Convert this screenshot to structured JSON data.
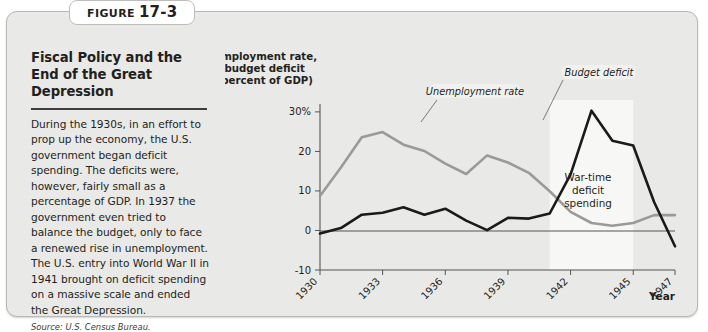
{
  "figure": {
    "label_word": "Figure",
    "number": "17-3",
    "title": "Fiscal Policy and the End of the Great Depression",
    "body": "During the 1930s, in an effort to prop up the economy, the U.S. government began deficit spending. The deficits were, however, fairly small as a percentage of GDP. In 1937 the government even tried to balance the budget, only to face a renewed rise in unemployment. The U.S. entry into World War II in 1941 brought on deficit spending on a massive scale and ended the Great Depression.",
    "source": "Source: U.S. Census Bureau."
  },
  "chart_data": {
    "type": "line",
    "title": "",
    "ylabel_lines": [
      "Unemployment rate,",
      "budget deficit",
      "(percent of GDP)"
    ],
    "xlabel": "Year",
    "ylim": [
      -10,
      32
    ],
    "xlim": [
      1930,
      1947
    ],
    "ytick_labels": [
      "30%",
      "20",
      "10",
      "0",
      "-10"
    ],
    "ytick_values": [
      30,
      20,
      10,
      0,
      -10
    ],
    "xtick_labels": [
      "1930",
      "1933",
      "1936",
      "1939",
      "1942",
      "1945",
      "1947"
    ],
    "xtick_values": [
      1930,
      1933,
      1936,
      1939,
      1942,
      1945,
      1947
    ],
    "grid": false,
    "legend_position": "inline-callouts",
    "x": [
      1930,
      1931,
      1932,
      1933,
      1934,
      1935,
      1936,
      1937,
      1938,
      1939,
      1940,
      1941,
      1942,
      1943,
      1944,
      1945,
      1946,
      1947
    ],
    "series": [
      {
        "name": "Unemployment rate",
        "color": "#9a9a9a",
        "values": [
          8.7,
          15.9,
          23.6,
          24.9,
          21.7,
          20.1,
          16.9,
          14.3,
          19.0,
          17.2,
          14.6,
          9.9,
          4.7,
          1.9,
          1.2,
          1.9,
          3.9,
          3.9
        ]
      },
      {
        "name": "Budget deficit",
        "color": "#1a1a1a",
        "values": [
          -0.8,
          0.6,
          4.0,
          4.5,
          5.9,
          4.0,
          5.5,
          2.5,
          0.1,
          3.2,
          3.0,
          4.3,
          14.2,
          30.3,
          22.7,
          21.5,
          7.2,
          -4.0
        ]
      }
    ],
    "annotations": [
      {
        "name": "unemployment-callout",
        "text": "Unemployment rate"
      },
      {
        "name": "budget-deficit-callout",
        "text": "Budget deficit"
      },
      {
        "name": "wartime-band-label",
        "text_lines": [
          "War-time",
          "deficit",
          "spending"
        ]
      }
    ],
    "shaded_band": {
      "name": "war-time-band",
      "x_start": 1941,
      "x_end": 1945,
      "color": "#f7f7f6"
    }
  }
}
